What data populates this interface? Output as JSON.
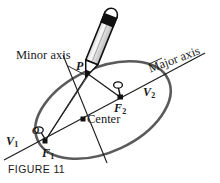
{
  "figure": {
    "caption": "FIGURE 11",
    "colors": {
      "ellipse_stroke": "#5a5a5a",
      "line_stroke": "#1a1a1a",
      "text": "#1a1a1a",
      "background": "#ffffff",
      "pencil_body": "#f2f2f2",
      "pencil_tip_dark": "#111111"
    },
    "labels": {
      "minor_axis": "Minor axis",
      "major_axis": "Major axis",
      "center": "Center",
      "point_p": "P",
      "vertex_1": "V",
      "vertex_1_sub": "1",
      "vertex_2": "V",
      "vertex_2_sub": "2",
      "focus_1": "F",
      "focus_1_sub": "1",
      "focus_2": "F",
      "focus_2_sub": "2",
      "tack_left": "O",
      "tack_right": "O"
    },
    "geometry": {
      "ellipse": {
        "cx": 103,
        "cy": 110,
        "rx": 72,
        "ry": 42,
        "rotation_deg": -25
      },
      "points": {
        "P": [
          88,
          73
        ],
        "F1": [
          45,
          141
        ],
        "F2": [
          120,
          97
        ],
        "center": [
          83,
          119
        ],
        "V1": [
          25,
          154
        ],
        "V2": [
          160,
          85
        ]
      },
      "major_axis_line": [
        [
          4,
          160
        ],
        [
          205,
          53
        ]
      ],
      "minor_axis_line": [
        [
          63,
          55
        ],
        [
          107,
          163
        ]
      ],
      "minor_axis_leader": [
        [
          70,
          68
        ],
        [
          86,
          75
        ]
      ],
      "major_axis_leader": [
        [
          150,
          63
        ],
        [
          163,
          58
        ]
      ]
    }
  }
}
